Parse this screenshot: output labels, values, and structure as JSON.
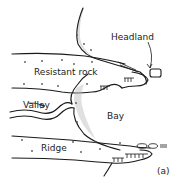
{
  "diagram": {
    "type": "geomorphology-sketch",
    "labels": {
      "headland": "Headland",
      "resistant_rock": "Resistant rock",
      "valley": "Valley",
      "bay": "Bay",
      "ridge": "Ridge",
      "panel": "(a)"
    },
    "colors": {
      "line": "#1a1a1a",
      "stipple": "#bbbbbb",
      "background": "#ffffff"
    }
  }
}
